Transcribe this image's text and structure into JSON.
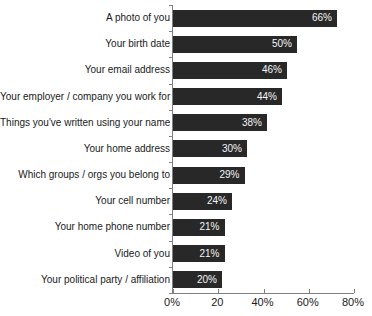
{
  "chart_data": {
    "type": "bar",
    "orientation": "horizontal",
    "title": "",
    "categories": [
      "A photo of you",
      "Your birth date",
      "Your email address",
      "Your employer / company you work for",
      "Things you've written using your name",
      "Your home address",
      "Which groups / orgs you belong to",
      "Your cell number",
      "Your home phone number",
      "Video of you",
      "Your political party / affiliation"
    ],
    "values": [
      66,
      50,
      46,
      44,
      38,
      30,
      29,
      24,
      21,
      21,
      20
    ],
    "display_values": [
      "66%",
      "50%",
      "46%",
      "44%",
      "38%",
      "30%",
      "29%",
      "24%",
      "21%",
      "21%",
      "20%"
    ],
    "xlim": [
      0,
      80
    ],
    "x_ticks": [
      0,
      20,
      40,
      60,
      80
    ],
    "x_tick_labels": [
      "0%",
      "20",
      "40%",
      "60%",
      "80%"
    ],
    "grid": false,
    "legend": "none",
    "bar_color": "#282828",
    "value_label_color": "#f5f5f5",
    "axis_color": "#808080",
    "label_color": "#1a1a1a"
  }
}
